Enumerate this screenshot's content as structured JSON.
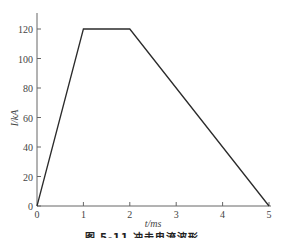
{
  "chart_data": {
    "type": "line",
    "title": "",
    "xlabel": "t/ms",
    "ylabel": "I/kA",
    "x": [
      0,
      1,
      2,
      5
    ],
    "series": [
      {
        "name": "I",
        "values": [
          0,
          120,
          120,
          0
        ]
      }
    ],
    "xticks": [
      "0",
      "1",
      "2",
      "3",
      "4",
      "5"
    ],
    "yticks": [
      "0",
      "20",
      "40",
      "60",
      "80",
      "100",
      "120"
    ],
    "xlim": [
      0,
      5
    ],
    "ylim": [
      0,
      130
    ],
    "grid": false,
    "legend": "none"
  },
  "labels": {
    "xlabel": "t/ms",
    "ylabel": "I/kA",
    "x_ticks": [
      "0",
      "1",
      "2",
      "3",
      "4",
      "5"
    ],
    "y_ticks": [
      "0",
      "20",
      "40",
      "60",
      "80",
      "100",
      "120"
    ],
    "caption": "图 5-11  冲击电流波形"
  },
  "colors": {
    "line": "#2b2b2b",
    "axis": "#555555"
  }
}
